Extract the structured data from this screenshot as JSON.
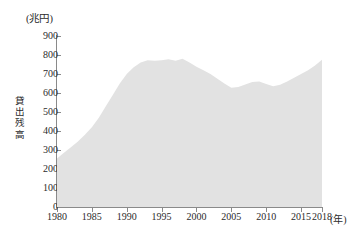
{
  "chart_data": {
    "type": "area",
    "title": "",
    "subtitle": "",
    "unit_label": "(兆円)",
    "xlabel": "(年)",
    "ylabel": "貸出残高",
    "ylabel_chars": [
      "貸",
      "出",
      "残",
      "高"
    ],
    "grid": false,
    "legend": "none",
    "xlim": [
      1980,
      2018
    ],
    "ylim": [
      0,
      900
    ],
    "y_ticks": [
      900,
      800,
      700,
      600,
      500,
      400,
      300,
      200,
      100,
      0
    ],
    "y_tick_labels": [
      "900",
      "800",
      "700",
      "600",
      "500",
      "400",
      "300",
      "200",
      "100",
      "0"
    ],
    "x_ticks": [
      1980,
      1985,
      1990,
      1995,
      2000,
      2005,
      2010,
      2015,
      2018
    ],
    "x_tick_labels": [
      "1980",
      "1985",
      "1990",
      "1995",
      "2000",
      "2005",
      "2010",
      "2015",
      "2018"
    ],
    "series": [
      {
        "name": "貸出残高",
        "fill_color": "#e2e2e2",
        "x": [
          1980,
          1981,
          1982,
          1983,
          1984,
          1985,
          1986,
          1987,
          1988,
          1989,
          1990,
          1991,
          1992,
          1993,
          1994,
          1995,
          1996,
          1997,
          1998,
          1999,
          2000,
          2001,
          2002,
          2003,
          2004,
          2005,
          2006,
          2007,
          2008,
          2009,
          2010,
          2011,
          2012,
          2013,
          2014,
          2015,
          2016,
          2017,
          2018
        ],
        "values": [
          255,
          285,
          315,
          345,
          380,
          420,
          470,
          530,
          590,
          650,
          700,
          735,
          760,
          772,
          770,
          772,
          778,
          770,
          780,
          760,
          738,
          720,
          700,
          675,
          650,
          628,
          632,
          645,
          658,
          660,
          648,
          635,
          643,
          660,
          680,
          700,
          720,
          745,
          775
        ]
      }
    ],
    "colors": {
      "area_fill": "#e2e2e2",
      "axis": "#8a8a8a",
      "text": "#2b2b2b",
      "background": "#ffffff"
    }
  }
}
